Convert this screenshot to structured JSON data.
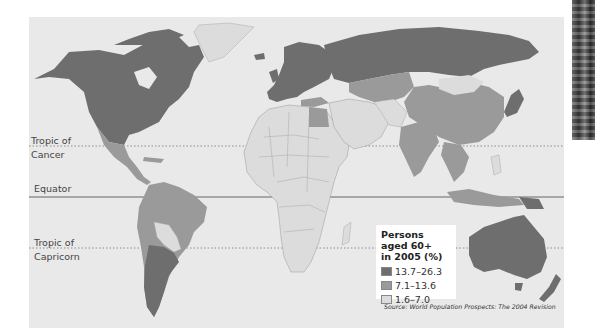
{
  "map": {
    "title": "Persons aged 60+ in 2005 (%)",
    "latitude_lines": [
      {
        "name": "Tropic of Cancer",
        "label_line1": "Tropic of",
        "label_line2": "Cancer",
        "style": "dotted"
      },
      {
        "name": "Equator",
        "label_line1": "Equator",
        "style": "solid"
      },
      {
        "name": "Tropic of Capricorn",
        "label_line1": "Tropic of",
        "label_line2": "Capricorn",
        "style": "dotted"
      }
    ],
    "legend": {
      "title_line1": "Persons aged 60+",
      "title_line2": "in 2005 (%)",
      "items": [
        {
          "label": "13.7–26.3",
          "color": "#6e6e6e"
        },
        {
          "label": "7.1–13.6",
          "color": "#9a9a9a"
        },
        {
          "label": "1.6–7.0",
          "color": "#dcdcdc"
        }
      ]
    },
    "regions": {
      "high_13.7_26.3": [
        "North America",
        "Europe",
        "Russia",
        "Japan",
        "Australia",
        "New Zealand",
        "Argentina",
        "Chile",
        "Uruguay"
      ],
      "mid_7.1_13.6": [
        "Mexico",
        "South America (most)",
        "China",
        "India",
        "Southeast Asia",
        "Central Asia",
        "Turkey",
        "Egypt",
        "Indonesia"
      ],
      "low_1.6_7.0": [
        "Africa (most)",
        "Middle East",
        "Greenland",
        "Mongolia",
        "Bolivia",
        "Paraguay",
        "Afghanistan",
        "Pakistan"
      ]
    },
    "source": "Source: World Population Prospects: The 2004 Revision"
  }
}
